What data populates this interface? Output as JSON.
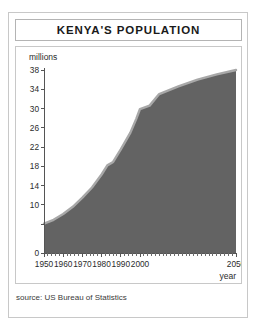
{
  "figure": {
    "title": "KENYA'S POPULATION",
    "source_note": "source: US Bureau of Statistics"
  },
  "chart_data": {
    "type": "area",
    "title": "KENYA'S POPULATION",
    "xlabel": "year",
    "ylabel": "millions",
    "xlim": [
      1950,
      2050
    ],
    "ylim": [
      0,
      38
    ],
    "grid": false,
    "legend": null,
    "y_ticks": [
      0,
      6,
      10,
      14,
      18,
      22,
      26,
      30,
      34,
      38
    ],
    "y_tick_labels": [
      "0",
      "",
      "10",
      "14",
      "18",
      "22",
      "26",
      "30",
      "34",
      "38"
    ],
    "y_tick_step": 4,
    "x_ticks": [
      1950,
      1960,
      1970,
      1980,
      1990,
      2000,
      2050
    ],
    "x_tick_labels": [
      "1950",
      "1960",
      "1970",
      "1980",
      "1990",
      "2000",
      "2050"
    ],
    "x_minor_tick_step": 2,
    "series": [
      {
        "name": "Kenya population (millions)",
        "x": [
          1950,
          1955,
          1960,
          1965,
          1970,
          1975,
          1980,
          1983,
          1986,
          1990,
          1995,
          1998,
          2000,
          2005,
          2010,
          2020,
          2030,
          2040,
          2050
        ],
        "values": [
          6.1,
          6.9,
          8.1,
          9.6,
          11.5,
          13.6,
          16.3,
          18.2,
          18.9,
          21.5,
          25.0,
          27.8,
          29.9,
          30.6,
          33.0,
          34.6,
          36.0,
          37.1,
          38.0
        ]
      }
    ],
    "colors": {
      "area_fill": "#636363",
      "area_edge": "#a8a8a8",
      "axis": "#555555",
      "text": "#2b2b2b",
      "frame": "#c8c8c8",
      "background": "#ffffff"
    }
  }
}
